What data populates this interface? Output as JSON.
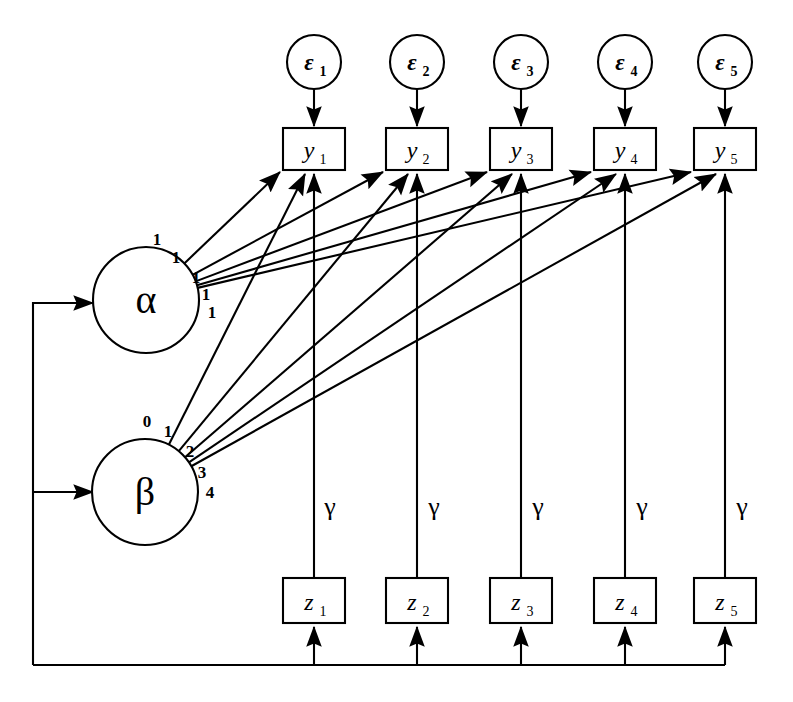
{
  "diagram": {
    "type": "sem-path-diagram",
    "background": "#ffffff",
    "stroke": "#000000"
  },
  "latent_factors": [
    {
      "id": "alpha",
      "label": "α",
      "cx": 146,
      "cy": 300,
      "r": 53
    },
    {
      "id": "beta",
      "label": "β",
      "cx": 145,
      "cy": 492,
      "r": 53
    }
  ],
  "residuals": [
    {
      "id": "e1",
      "label": "ε",
      "sub": "1",
      "cx": 314,
      "cy": 62,
      "r": 27
    },
    {
      "id": "e2",
      "label": "ε",
      "sub": "2",
      "cx": 417,
      "cy": 62,
      "r": 27
    },
    {
      "id": "e3",
      "label": "ε",
      "sub": "3",
      "cx": 521,
      "cy": 62,
      "r": 27
    },
    {
      "id": "e4",
      "label": "ε",
      "sub": "4",
      "cx": 625,
      "cy": 62,
      "r": 27
    },
    {
      "id": "e5",
      "label": "ε",
      "sub": "5",
      "cx": 725,
      "cy": 62,
      "r": 27
    }
  ],
  "indicators": [
    {
      "id": "y1",
      "label": "y",
      "sub": "1",
      "x": 283,
      "y": 128,
      "w": 62,
      "h": 42
    },
    {
      "id": "y2",
      "label": "y",
      "sub": "2",
      "x": 386,
      "y": 128,
      "w": 62,
      "h": 42
    },
    {
      "id": "y3",
      "label": "y",
      "sub": "3",
      "x": 490,
      "y": 128,
      "w": 62,
      "h": 42
    },
    {
      "id": "y4",
      "label": "y",
      "sub": "4",
      "x": 594,
      "y": 128,
      "w": 62,
      "h": 42
    },
    {
      "id": "y5",
      "label": "y",
      "sub": "5",
      "x": 694,
      "y": 128,
      "w": 62,
      "h": 42
    }
  ],
  "covariates": [
    {
      "id": "z1",
      "label": "z",
      "sub": "1",
      "x": 283,
      "y": 578,
      "w": 62,
      "h": 45
    },
    {
      "id": "z2",
      "label": "z",
      "sub": "2",
      "x": 386,
      "y": 578,
      "w": 62,
      "h": 45
    },
    {
      "id": "z3",
      "label": "z",
      "sub": "3",
      "x": 490,
      "y": 578,
      "w": 62,
      "h": 45
    },
    {
      "id": "z4",
      "label": "z",
      "sub": "4",
      "x": 594,
      "y": 578,
      "w": 62,
      "h": 45
    },
    {
      "id": "z5",
      "label": "z",
      "sub": "5",
      "x": 694,
      "y": 578,
      "w": 62,
      "h": 45
    }
  ],
  "intercept_loadings": {
    "from": "alpha",
    "labels": [
      "1",
      "1",
      "1",
      "1",
      "1"
    ],
    "label_positions": [
      {
        "x": 157,
        "y": 245
      },
      {
        "x": 176,
        "y": 263
      },
      {
        "x": 196,
        "y": 283
      },
      {
        "x": 206,
        "y": 300
      },
      {
        "x": 212,
        "y": 318
      }
    ]
  },
  "slope_loadings": {
    "from": "beta",
    "labels": [
      "0",
      "1",
      "2",
      "3",
      "4"
    ],
    "label_positions": [
      {
        "x": 147,
        "y": 427
      },
      {
        "x": 168,
        "y": 437
      },
      {
        "x": 190,
        "y": 457
      },
      {
        "x": 202,
        "y": 478
      },
      {
        "x": 210,
        "y": 498
      }
    ]
  },
  "covariate_paths": {
    "label": "γ",
    "labels": [
      "γ",
      "γ",
      "γ",
      "γ",
      "γ"
    ],
    "label_positions": [
      {
        "x": 330,
        "y": 515
      },
      {
        "x": 434,
        "y": 515
      },
      {
        "x": 538,
        "y": 515
      },
      {
        "x": 642,
        "y": 515
      },
      {
        "x": 742,
        "y": 515
      }
    ]
  },
  "feedback_bus": {
    "y": 665,
    "left_x": 33,
    "right_x": 725,
    "alpha_entry_y": 303,
    "beta_entry_y": 492,
    "arrow_tip_x": 93
  }
}
